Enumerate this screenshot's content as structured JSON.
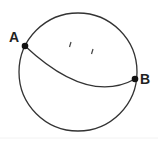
{
  "diagram": {
    "type": "circle-with-arc",
    "circle": {
      "cx": 78,
      "cy": 72,
      "r": 59,
      "stroke": "#333333"
    },
    "points": [
      {
        "label": "A",
        "x": 25,
        "y": 46
      },
      {
        "label": "B",
        "x": 135,
        "y": 79
      }
    ],
    "arc": {
      "from": "A",
      "to": "B",
      "control_x": 88,
      "control_y": 105
    },
    "tick_marks": [
      {
        "x": 70,
        "y": 44
      },
      {
        "x": 92,
        "y": 51
      }
    ]
  },
  "labels": {
    "a": "A",
    "b": "B"
  }
}
